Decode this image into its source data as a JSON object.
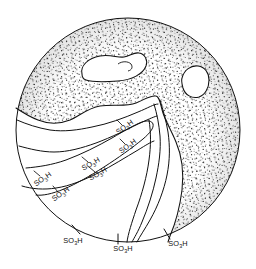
{
  "figure": {
    "domain": "diagram",
    "kind": "stippled-circular-micrograph-schematic",
    "background_color": "#ffffff",
    "ink_color": "#111111",
    "stipple_color": "#222222",
    "title": "",
    "caption": "",
    "circle": {
      "center_x": 128,
      "center_y": 130,
      "radius": 112,
      "outline_color": "#111111",
      "outline_width": 1.0
    },
    "regions": [
      {
        "name": "stippled-matrix",
        "fill": "stipple",
        "description": "dense dotted matrix occupying upper and right portion of the disc"
      },
      {
        "name": "clear-lamellar-domain",
        "fill": "white",
        "description": "blank wedge-shaped domain in lower-left with banded boundary curves"
      }
    ],
    "islands": [
      {
        "name": "island-left",
        "shape": "kidney",
        "fill": "white"
      },
      {
        "name": "island-right",
        "shape": "rounded-triangle",
        "fill": "white"
      }
    ],
    "labels": [
      {
        "id": "label-1",
        "text": "SO",
        "sub": "3",
        "tail": "H",
        "x": 44,
        "y": 181,
        "rotate": -34,
        "anchor": "middle",
        "has_tick": true,
        "tick_angle": -34
      },
      {
        "id": "label-2",
        "text": "SO",
        "sub": "3",
        "tail": "H",
        "x": 62,
        "y": 196,
        "rotate": -34,
        "anchor": "middle",
        "has_tick": true,
        "tick_angle": -34
      },
      {
        "id": "label-3",
        "text": "SO",
        "sub": "3",
        "tail": "H",
        "x": 92,
        "y": 166,
        "rotate": -30,
        "anchor": "middle",
        "has_tick": true,
        "tick_angle": -30
      },
      {
        "id": "label-4",
        "text": "SO",
        "sub": "3",
        "tail": "H",
        "x": 99,
        "y": 176,
        "rotate": -30,
        "anchor": "middle",
        "has_tick": true,
        "tick_angle": -30
      },
      {
        "id": "label-5",
        "text": "SO",
        "sub": "3",
        "tail": "H",
        "x": 126,
        "y": 129,
        "rotate": -36,
        "anchor": "middle",
        "has_tick": true,
        "tick_angle": -36
      },
      {
        "id": "label-6",
        "text": "SO",
        "sub": "3",
        "tail": "H",
        "x": 129,
        "y": 148,
        "rotate": -36,
        "anchor": "middle",
        "has_tick": true,
        "tick_angle": -36
      },
      {
        "id": "label-7",
        "text": "SO",
        "sub": "3",
        "tail": "H",
        "x": 73,
        "y": 243,
        "rotate": 0,
        "anchor": "middle",
        "has_tick": false,
        "tick_angle": 0
      },
      {
        "id": "label-8",
        "text": "SO",
        "sub": "3",
        "tail": "H",
        "x": 123,
        "y": 251,
        "rotate": 0,
        "anchor": "middle",
        "has_tick": false,
        "tick_angle": 0
      },
      {
        "id": "label-9",
        "text": "SO",
        "sub": "3",
        "tail": "H",
        "x": 178,
        "y": 246,
        "rotate": 0,
        "anchor": "middle",
        "has_tick": false,
        "tick_angle": 0
      }
    ],
    "rim_ticks": [
      {
        "id": "rim-tick-left",
        "x": 76,
        "y": 230
      },
      {
        "id": "rim-tick-center",
        "x": 118,
        "y": 239
      },
      {
        "id": "rim-tick-right",
        "x": 167,
        "y": 234
      }
    ],
    "label_text_full": "SO3H"
  }
}
